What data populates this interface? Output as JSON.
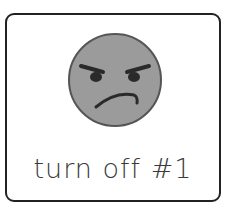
{
  "card": {
    "label": "turn off #1",
    "icon": "angry-face-icon",
    "colors": {
      "border": "#222222",
      "face_fill": "#9b9b9b",
      "face_outline": "#555555",
      "features": "#2a2a2a",
      "text": "#3a3a3a"
    }
  }
}
